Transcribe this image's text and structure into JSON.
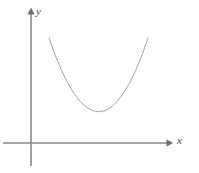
{
  "figure": {
    "name": "parabola-coordinate-plot",
    "width": 199,
    "height": 173,
    "background_color": "#ffffff"
  },
  "axes": {
    "x_axis": {
      "label": "x",
      "color": "#888888",
      "start_x": 3,
      "end_x": 172,
      "y": 143,
      "arrow": "right-arrowhead"
    },
    "y_axis": {
      "label": "y",
      "color": "#888888",
      "x": 31,
      "start_y": 166,
      "end_y": 8,
      "arrow": "up-arrowhead"
    }
  },
  "chart_data": {
    "type": "line",
    "title": "",
    "subtitle": "",
    "xlabel": "x",
    "ylabel": "y",
    "grid": false,
    "legend": "none",
    "curve_color": "#9a9a9a",
    "curve_width": 0.9,
    "xlim": [
      3,
      172
    ],
    "ylim": [
      8,
      166
    ],
    "origin": {
      "x": 31,
      "y": 143
    },
    "series": [
      {
        "name": "parabola",
        "shape": "parabola-upward",
        "vertex": {
          "x": 99,
          "y": 112
        },
        "left_endpoint": {
          "x": 49,
          "y": 38
        },
        "right_endpoint": {
          "x": 148,
          "y": 38
        },
        "points": [
          {
            "x": 49,
            "y": 38
          },
          {
            "x": 54,
            "y": 46.4
          },
          {
            "x": 59,
            "y": 54.1
          },
          {
            "x": 64,
            "y": 61.2
          },
          {
            "x": 69,
            "y": 67.6
          },
          {
            "x": 74,
            "y": 73.3
          },
          {
            "x": 79,
            "y": 78.4
          },
          {
            "x": 84,
            "y": 82.8
          },
          {
            "x": 89,
            "y": 86.6
          },
          {
            "x": 94,
            "y": 89.7
          },
          {
            "x": 99,
            "y": 112
          },
          {
            "x": 104,
            "y": 89.7
          },
          {
            "x": 109,
            "y": 86.6
          },
          {
            "x": 114,
            "y": 82.8
          },
          {
            "x": 119,
            "y": 78.4
          },
          {
            "x": 124,
            "y": 73.3
          },
          {
            "x": 129,
            "y": 67.6
          },
          {
            "x": 134,
            "y": 61.2
          },
          {
            "x": 139,
            "y": 54.1
          },
          {
            "x": 144,
            "y": 46.4
          },
          {
            "x": 148,
            "y": 38
          }
        ],
        "path": "M 49 38 Q 99 186 148 38"
      }
    ]
  },
  "ghost_text": {
    "note": "faint bleed-through text from reverse side of page, nearly illegible",
    "top_line_1": "—— ——— —— ———",
    "top_line_2": "——— ———— ——",
    "bottom_line_1": "——— ———— ——— ——",
    "bottom_line_2": "—— ———— ——— ————"
  }
}
